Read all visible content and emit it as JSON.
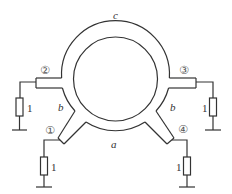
{
  "diagram": {
    "type": "hybrid ring (rat-race) coupler",
    "ring_labels": {
      "top": "c",
      "bottom": "a",
      "left_side": "b",
      "right_side": "b"
    },
    "ports": [
      {
        "id": "1",
        "symbol": "①",
        "load": "1"
      },
      {
        "id": "2",
        "symbol": "②",
        "load": "1"
      },
      {
        "id": "3",
        "symbol": "③",
        "load": "1"
      },
      {
        "id": "4",
        "symbol": "④",
        "load": "1"
      }
    ],
    "colors": {
      "line": "#333333",
      "text": "#333333",
      "background": "#ffffff"
    }
  }
}
